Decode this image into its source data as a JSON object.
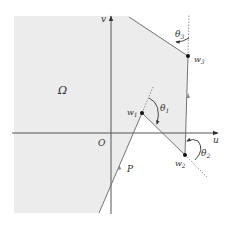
{
  "diagram": {
    "region_label": "Ω",
    "axis_v_label": "v",
    "axis_u_label": "u",
    "origin_label": "O",
    "path_label": "P",
    "points": [
      {
        "name": "w",
        "sub": "1"
      },
      {
        "name": "w",
        "sub": "2"
      },
      {
        "name": "w",
        "sub": "3"
      }
    ],
    "angles": [
      {
        "name": "θ",
        "sub": "1"
      },
      {
        "name": "θ",
        "sub": "2"
      },
      {
        "name": "θ",
        "sub": "3"
      }
    ],
    "colors": {
      "region_fill": "#ececec",
      "line": "#555555",
      "axis": "#444444",
      "dotted": "#777777"
    }
  }
}
